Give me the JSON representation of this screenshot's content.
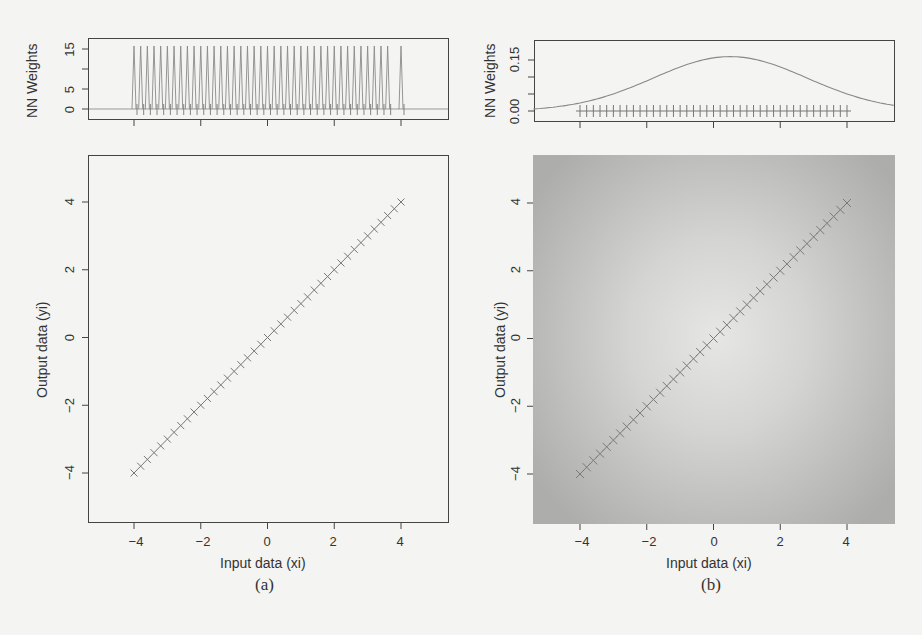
{
  "figure": {
    "panel_a": {
      "caption": "(a)",
      "top_plot": {
        "ylabel": "NN Weights",
        "yticks": [
          "0",
          "5",
          "15"
        ],
        "ytick_values": [
          0,
          5,
          10,
          15
        ]
      },
      "main_plot": {
        "xlabel": "Input data (xi)",
        "ylabel": "Output data (yi)",
        "xticks": [
          "−4",
          "−2",
          "0",
          "2",
          "4"
        ],
        "yticks": [
          "−4",
          "−2",
          "0",
          "2",
          "4"
        ],
        "background": "#f4f4f2"
      }
    },
    "panel_b": {
      "caption": "(b)",
      "top_plot": {
        "ylabel": "NN Weights",
        "yticks": [
          "0.00",
          "0.15"
        ],
        "ytick_values": [
          0.0,
          0.05,
          0.1,
          0.15
        ]
      },
      "main_plot": {
        "xlabel": "Input data (xi)",
        "ylabel": "Output data (yi)",
        "xticks": [
          "−4",
          "−2",
          "0",
          "2",
          "4"
        ],
        "yticks": [
          "−4",
          "−2",
          "0",
          "2",
          "4"
        ],
        "background": "radial gray gradient (light center, darker edges)"
      }
    }
  },
  "chart_data": [
    {
      "type": "line",
      "panel": "a-top",
      "title": "",
      "xlabel": "",
      "ylabel": "NN Weights",
      "xlim": [
        -5.4,
        5.4
      ],
      "ylim": [
        -1.5,
        18
      ],
      "description": "Spike train: narrow weight peaks (~16) at each training input xi, near zero elsewhere; one isolated spike at x=4",
      "x": [
        -4.0,
        -3.8,
        -3.6,
        -3.4,
        -3.2,
        -3.0,
        -2.8,
        -2.6,
        -2.4,
        -2.2,
        -2.0,
        -1.8,
        -1.6,
        -1.4,
        -1.2,
        -1.0,
        -0.8,
        -0.6,
        -0.4,
        -0.2,
        0.0,
        0.2,
        0.4,
        0.6,
        0.8,
        1.0,
        1.2,
        1.4,
        1.6,
        1.8,
        2.0,
        2.2,
        2.4,
        2.6,
        2.8,
        3.0,
        3.2,
        3.4,
        3.6,
        4.0
      ],
      "peak_value": 16,
      "baseline": 0
    },
    {
      "type": "scatter",
      "panel": "a-main",
      "title": "",
      "xlabel": "Input data (xi)",
      "ylabel": "Output data (yi)",
      "xlim": [
        -5.4,
        5.4
      ],
      "ylim": [
        -5.4,
        5.4
      ],
      "marker": "x",
      "x": [
        -4.0,
        -3.8,
        -3.6,
        -3.4,
        -3.2,
        -3.0,
        -2.8,
        -2.6,
        -2.4,
        -2.2,
        -2.0,
        -1.8,
        -1.6,
        -1.4,
        -1.2,
        -1.0,
        -0.8,
        -0.6,
        -0.4,
        -0.2,
        0.0,
        0.2,
        0.4,
        0.6,
        0.8,
        1.0,
        1.2,
        1.4,
        1.6,
        1.8,
        2.0,
        2.2,
        2.4,
        2.6,
        2.8,
        3.0,
        3.2,
        3.4,
        3.6,
        3.8,
        4.0
      ],
      "y": [
        -4.0,
        -3.8,
        -3.6,
        -3.4,
        -3.2,
        -3.0,
        -2.8,
        -2.6,
        -2.4,
        -2.2,
        -2.0,
        -1.8,
        -1.6,
        -1.4,
        -1.2,
        -1.0,
        -0.8,
        -0.6,
        -0.4,
        -0.2,
        0.0,
        0.2,
        0.4,
        0.6,
        0.8,
        1.0,
        1.2,
        1.4,
        1.6,
        1.8,
        2.0,
        2.2,
        2.4,
        2.6,
        2.8,
        3.0,
        3.2,
        3.4,
        3.6,
        3.8,
        4.0
      ],
      "xticks": [
        -4,
        -2,
        0,
        2,
        4
      ],
      "yticks": [
        -4,
        -2,
        0,
        2,
        4
      ]
    },
    {
      "type": "line",
      "panel": "b-top",
      "title": "",
      "xlabel": "",
      "ylabel": "NN Weights",
      "xlim": [
        -5.4,
        5.4
      ],
      "ylim": [
        -0.01,
        0.19
      ],
      "description": "Smooth Gaussian-like weight curve peaking ~0.16 near x=0.5; '+' markers at training inputs along y=0",
      "x": [
        -5.4,
        -4,
        -3,
        -2,
        -1,
        0,
        0.5,
        1,
        2,
        3,
        4,
        5.4
      ],
      "values": [
        0.01,
        0.03,
        0.055,
        0.095,
        0.135,
        0.158,
        0.16,
        0.155,
        0.125,
        0.085,
        0.05,
        0.02
      ],
      "markers_x": [
        -4.0,
        -3.8,
        -3.6,
        -3.4,
        -3.2,
        -3.0,
        -2.8,
        -2.6,
        -2.4,
        -2.2,
        -2.0,
        -1.8,
        -1.6,
        -1.4,
        -1.2,
        -1.0,
        -0.8,
        -0.6,
        -0.4,
        -0.2,
        0.0,
        0.2,
        0.4,
        0.6,
        0.8,
        1.0,
        1.2,
        1.4,
        1.6,
        1.8,
        2.0,
        2.2,
        2.4,
        2.6,
        2.8,
        3.0,
        3.2,
        3.4,
        3.6,
        3.8,
        4.0
      ],
      "markers_y": 0
    },
    {
      "type": "heatmap",
      "panel": "b-main",
      "title": "",
      "xlabel": "Input data (xi)",
      "ylabel": "Output data (yi)",
      "xlim": [
        -5.4,
        5.4
      ],
      "ylim": [
        -5.4,
        5.4
      ],
      "description": "Grayscale density background, brightest near (0.3, 0.2), darker toward edges; overlaid x markers along y = x from -4 to 4",
      "marker": "x",
      "x": [
        -4.0,
        -3.8,
        -3.6,
        -3.4,
        -3.2,
        -3.0,
        -2.8,
        -2.6,
        -2.4,
        -2.2,
        -2.0,
        -1.8,
        -1.6,
        -1.4,
        -1.2,
        -1.0,
        -0.8,
        -0.6,
        -0.4,
        -0.2,
        0.0,
        0.2,
        0.4,
        0.6,
        0.8,
        1.0,
        1.2,
        1.4,
        1.6,
        1.8,
        2.0,
        2.2,
        2.4,
        2.6,
        2.8,
        3.0,
        3.2,
        3.4,
        3.6,
        3.8,
        4.0
      ],
      "y": [
        -4.0,
        -3.8,
        -3.6,
        -3.4,
        -3.2,
        -3.0,
        -2.8,
        -2.6,
        -2.4,
        -2.2,
        -2.0,
        -1.8,
        -1.6,
        -1.4,
        -1.2,
        -1.0,
        -0.8,
        -0.6,
        -0.4,
        -0.2,
        0.0,
        0.2,
        0.4,
        0.6,
        0.8,
        1.0,
        1.2,
        1.4,
        1.6,
        1.8,
        2.0,
        2.2,
        2.4,
        2.6,
        2.8,
        3.0,
        3.2,
        3.4,
        3.6,
        3.8,
        4.0
      ],
      "xticks": [
        -4,
        -2,
        0,
        2,
        4
      ],
      "yticks": [
        -4,
        -2,
        0,
        2,
        4
      ]
    }
  ]
}
